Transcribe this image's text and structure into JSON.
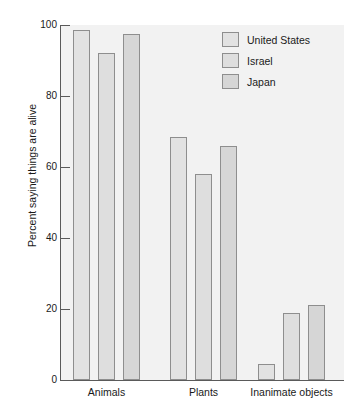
{
  "chart_data": {
    "type": "bar",
    "title": "",
    "subtitle": "",
    "xlabel": "",
    "ylabel": "Percent saying things are alive",
    "categories": [
      "Animals",
      "Plants",
      "Inanimate objects"
    ],
    "series": [
      {
        "name": "United States",
        "values": [
          98.5,
          68.5,
          4.5
        ]
      },
      {
        "name": "Israel",
        "values": [
          92,
          58,
          19
        ]
      },
      {
        "name": "Japan",
        "values": [
          97.5,
          66,
          21
        ]
      }
    ],
    "ylim": [
      0,
      100
    ],
    "yticks": [
      0,
      20,
      40,
      60,
      80,
      100
    ],
    "ytick_labels": [
      "0",
      "20",
      "40",
      "60",
      "80",
      "100"
    ],
    "grid": false,
    "legend_position": "top-right",
    "colors": {
      "series_0": "#e2e2e2",
      "series_1": "#dedede",
      "series_2": "#d6d6d6",
      "bar_border": "#8e8e8e",
      "axis": "#5a5a5a",
      "plot_background": "#f2f2f2",
      "text": "#1a1a1a"
    }
  },
  "legend": {
    "entries": [
      {
        "label": "United States"
      },
      {
        "label": "Israel"
      },
      {
        "label": "Japan"
      }
    ]
  }
}
